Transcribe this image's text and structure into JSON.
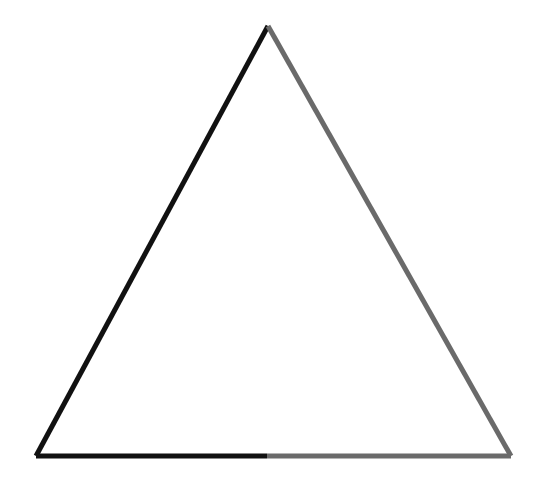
{
  "diagram": {
    "shape": "triangle",
    "vertices": {
      "apex": [
        268,
        26
      ],
      "bottom_left": [
        36,
        456
      ],
      "bottom_right": [
        511,
        456
      ],
      "bottom_midpoint": [
        267,
        456
      ]
    },
    "colors": {
      "background": "#ffffff",
      "dark_stroke": "#111111",
      "gray_stroke": "#6a6a6a"
    },
    "stroke_width": 5
  }
}
